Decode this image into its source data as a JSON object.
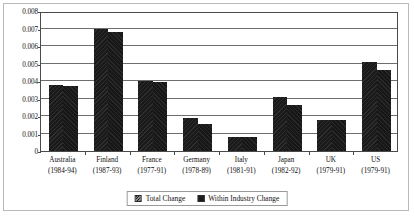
{
  "chart_data": {
    "type": "bar",
    "title": "",
    "xlabel": "",
    "ylabel": "",
    "ylim": [
      0,
      0.008
    ],
    "yticks": [
      "0",
      "0.001",
      "0.002",
      "0.003",
      "0.004",
      "0.005",
      "0.006",
      "0.007",
      "0.008"
    ],
    "ytick_values": [
      0,
      0.001,
      0.002,
      0.003,
      0.004,
      0.005,
      0.006,
      0.007,
      0.008
    ],
    "grid": true,
    "legend_position": "bottom",
    "categories": [
      {
        "name": "Australia",
        "years": "(1984-94)"
      },
      {
        "name": "Finland",
        "years": "(1987-93)"
      },
      {
        "name": "France",
        "years": "(1977-91)"
      },
      {
        "name": "Germany",
        "years": "(1978-89)"
      },
      {
        "name": "Italy",
        "years": "(1981-91)"
      },
      {
        "name": "Japan",
        "years": "(1982-92)"
      },
      {
        "name": "UK",
        "years": "(1979-91)"
      },
      {
        "name": "US",
        "years": "(1979-91)"
      }
    ],
    "series": [
      {
        "name": "Total Change",
        "color": "#1a1a1a",
        "values": [
          0.00375,
          0.007,
          0.00402,
          0.00189,
          0.00081,
          0.00307,
          0.00179,
          0.00506
        ]
      },
      {
        "name": "Within Industry Change",
        "color": "#1c1c1c",
        "values": [
          0.00373,
          0.0068,
          0.00393,
          0.00156,
          0.0008,
          0.00261,
          0.00178,
          0.00461
        ]
      }
    ]
  },
  "legend": {
    "entries": [
      {
        "label": "Total Change"
      },
      {
        "label": "Within Industry Change"
      }
    ]
  }
}
